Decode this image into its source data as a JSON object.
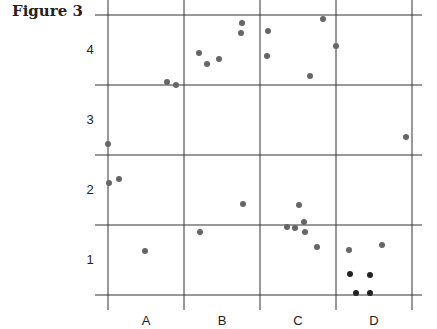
{
  "figure": {
    "title": "Figure 3"
  },
  "chart_data": {
    "type": "scatter",
    "title": "Figure 3",
    "xlabel": "",
    "ylabel": "",
    "x_categories": [
      "A",
      "B",
      "C",
      "D"
    ],
    "y_categories": [
      "1",
      "2",
      "3",
      "4"
    ],
    "grid": true,
    "point_color": "#666666",
    "dark_point_color": "#222222",
    "points": [
      {
        "x": 108,
        "y": 144
      },
      {
        "x": 109,
        "y": 183
      },
      {
        "x": 119,
        "y": 179
      },
      {
        "x": 145,
        "y": 251
      },
      {
        "x": 167,
        "y": 82
      },
      {
        "x": 176,
        "y": 85
      },
      {
        "x": 199,
        "y": 53
      },
      {
        "x": 207,
        "y": 64
      },
      {
        "x": 219,
        "y": 59
      },
      {
        "x": 242,
        "y": 23
      },
      {
        "x": 241,
        "y": 33
      },
      {
        "x": 200,
        "y": 232
      },
      {
        "x": 243,
        "y": 204
      },
      {
        "x": 268,
        "y": 31
      },
      {
        "x": 267,
        "y": 56
      },
      {
        "x": 310,
        "y": 76
      },
      {
        "x": 323,
        "y": 19
      },
      {
        "x": 336,
        "y": 46
      },
      {
        "x": 299,
        "y": 205
      },
      {
        "x": 304,
        "y": 222
      },
      {
        "x": 287,
        "y": 227
      },
      {
        "x": 295,
        "y": 228
      },
      {
        "x": 305,
        "y": 232
      },
      {
        "x": 317,
        "y": 247
      },
      {
        "x": 349,
        "y": 250
      },
      {
        "x": 382,
        "y": 245
      },
      {
        "x": 406,
        "y": 137
      }
    ],
    "dark_points": [
      {
        "x": 350,
        "y": 274
      },
      {
        "x": 370,
        "y": 275
      },
      {
        "x": 356,
        "y": 293
      },
      {
        "x": 370,
        "y": 293
      }
    ]
  }
}
